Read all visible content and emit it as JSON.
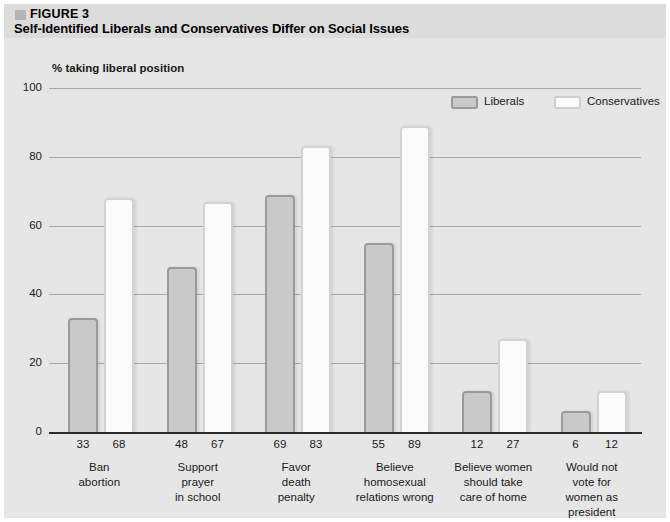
{
  "figure": {
    "number_label": "FIGURE 3",
    "title": "Self-Identified Liberals and Conservatives Differ on Social Issues"
  },
  "chart_data": {
    "type": "bar",
    "title": "Self-Identified Liberals and Conservatives Differ on Social Issues",
    "subtitle": "% taking liberal position",
    "xlabel": "",
    "ylabel": "% taking liberal position",
    "ylim": [
      0,
      100
    ],
    "yticks": [
      0,
      20,
      40,
      60,
      80,
      100
    ],
    "grid": true,
    "legend_position": "top-right",
    "categories": [
      "Ban abortion",
      "Support prayer in school",
      "Favor death penalty",
      "Believe homosexual relations wrong",
      "Believe women should take care of home",
      "Would not vote for women as president"
    ],
    "category_lines": [
      [
        "Ban",
        "abortion"
      ],
      [
        "Support",
        "prayer",
        "in school"
      ],
      [
        "Favor",
        "death",
        "penalty"
      ],
      [
        "Believe",
        "homosexual",
        "relations wrong"
      ],
      [
        "Believe women",
        "should take",
        "care of home"
      ],
      [
        "Would not",
        "vote for",
        "women as",
        "president"
      ]
    ],
    "series": [
      {
        "name": "Liberals",
        "color": "#c9c9c9",
        "border": "#9a9a9a",
        "values": [
          33,
          48,
          69,
          55,
          12,
          6
        ]
      },
      {
        "name": "Conservatives",
        "color": "#fbfbfb",
        "border": "#d2d2d2",
        "values": [
          68,
          67,
          83,
          89,
          27,
          12
        ]
      }
    ]
  }
}
